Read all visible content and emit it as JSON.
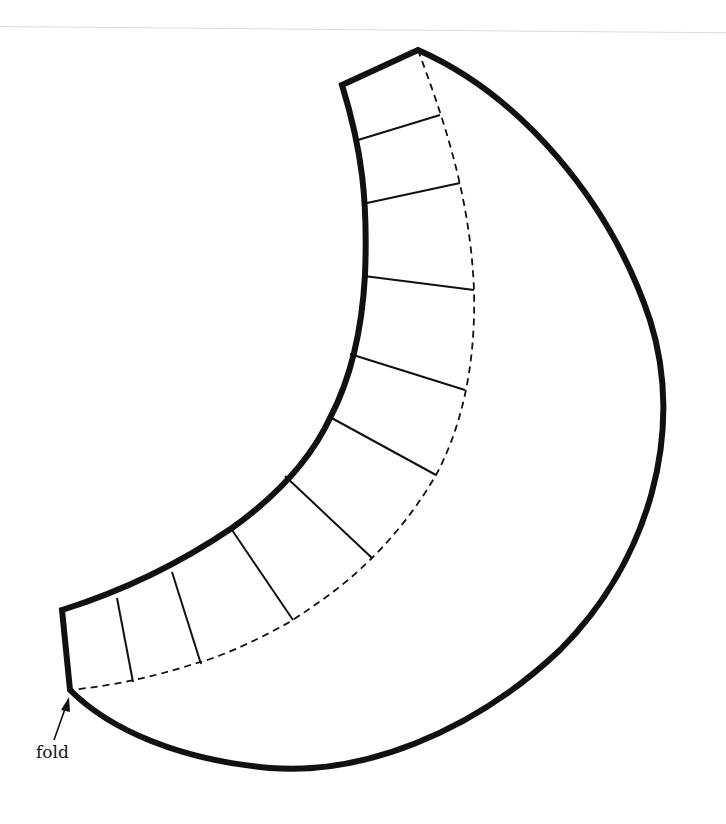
{
  "diagram": {
    "type": "sewing-pattern-piece",
    "shape": "crescent",
    "labels": {
      "fold": "fold"
    },
    "colors": {
      "outline": "#111111",
      "background": "#ffffff",
      "rule": "#dcdcdc"
    },
    "elements": {
      "outline": "thick solid crescent outline",
      "fold_line": "dashed line parallel to inner curve",
      "segment_lines": 10
    }
  }
}
